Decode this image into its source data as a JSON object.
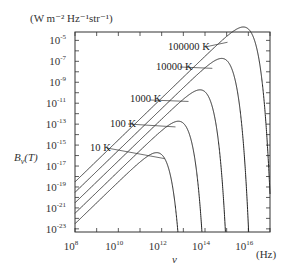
{
  "chart_data": {
    "type": "line",
    "title": "",
    "unit_label": "(W m⁻² Hz⁻¹str⁻¹)",
    "xlabel": "ν",
    "xunit": "(Hz)",
    "ylabel": "Bν(T)",
    "xscale": "log",
    "yscale": "log",
    "xlim_log10": [
      8,
      17
    ],
    "ylim_log10": [
      -23,
      -4
    ],
    "x_ticks": [
      "10^8",
      "10^10",
      "10^12",
      "10^14",
      "10^16"
    ],
    "y_ticks": [
      "10^-5",
      "10^-7",
      "10^-9",
      "10^-11",
      "10^-13",
      "10^-15",
      "10^-17",
      "10^-19",
      "10^-21",
      "10^-23"
    ],
    "grid": false,
    "series": [
      {
        "name": "10 K",
        "temperature_K": 10,
        "peak_freq_log10": 11.77,
        "peak_value_log10": -16.5
      },
      {
        "name": "100 K",
        "temperature_K": 100,
        "peak_freq_log10": 12.77,
        "peak_value_log10": -13.5
      },
      {
        "name": "1000 K",
        "temperature_K": 1000,
        "peak_freq_log10": 13.77,
        "peak_value_log10": -10.5
      },
      {
        "name": "10000 K",
        "temperature_K": 10000,
        "peak_freq_log10": 14.77,
        "peak_value_log10": -7.5
      },
      {
        "name": "100000 K",
        "temperature_K": 100000,
        "peak_freq_log10": 15.77,
        "peak_value_log10": -4.5
      }
    ],
    "annotations": [
      "10 K",
      "100 K",
      "1000 K",
      "10000 K",
      "100000 K"
    ]
  },
  "labels": {
    "unit": "(W m⁻² Hz⁻¹str⁻¹)",
    "ylabel_main": "B",
    "ylabel_sub": "ν",
    "ylabel_arg": "(T)",
    "xlabel": "ν",
    "xunit": "(Hz)",
    "base": "10"
  },
  "style": {
    "line_color": "#222222",
    "frame_color": "#333333"
  }
}
